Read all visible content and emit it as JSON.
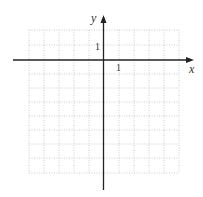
{
  "diagram": {
    "type": "coordinate-grid",
    "x_axis_label": "x",
    "y_axis_label": "y",
    "x_tick_label": "1",
    "y_tick_label": "1",
    "grid": {
      "columns": 10,
      "rows": 10,
      "x_range": [
        -5,
        5
      ],
      "y_range": [
        -8,
        2
      ],
      "cell_px": 15,
      "line_style": "dotted"
    },
    "colors": {
      "axis": "#222222",
      "grid": "#c8c8c8",
      "background": "#ffffff"
    }
  }
}
